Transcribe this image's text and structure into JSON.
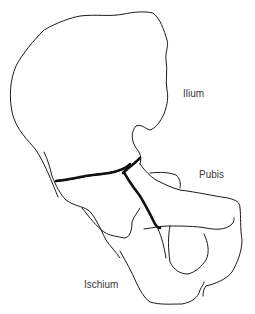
{
  "figure": {
    "type": "anatomical-line-drawing",
    "labels": {
      "ilium": "Ilium",
      "pubis": "Pubis",
      "ischium": "Ischium"
    },
    "colors": {
      "line": "#1a1a1a",
      "label_text": "#3a3a3a",
      "background": "#ffffff"
    }
  }
}
